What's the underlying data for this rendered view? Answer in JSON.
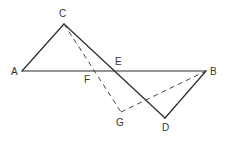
{
  "figure": {
    "points": {
      "A": {
        "label": "A",
        "x": 22,
        "y": 71,
        "lx": 11,
        "ly": 75
      },
      "B": {
        "label": "B",
        "x": 206,
        "y": 71,
        "lx": 210,
        "ly": 75
      },
      "C": {
        "label": "C",
        "x": 64,
        "y": 24,
        "lx": 59,
        "ly": 17
      },
      "D": {
        "label": "D",
        "x": 165,
        "y": 118,
        "lx": 162,
        "ly": 131
      },
      "E": {
        "label": "E",
        "x": 115,
        "y": 71,
        "lx": 115,
        "ly": 65
      },
      "F": {
        "label": "F",
        "x": 93,
        "y": 71,
        "lx": 84,
        "ly": 83
      },
      "G": {
        "label": "G",
        "x": 121,
        "y": 112,
        "lx": 116,
        "ly": 126
      }
    },
    "solid_segments": [
      [
        "A",
        "C"
      ],
      [
        "A",
        "B"
      ],
      [
        "C",
        "D"
      ],
      [
        "D",
        "B"
      ]
    ],
    "dashed_segments": [
      [
        "C",
        "G"
      ],
      [
        "G",
        "B"
      ]
    ],
    "colors": {
      "line": "#2a2a2a",
      "dashed": "#444444",
      "label": "#333333",
      "background": "#ffffff"
    }
  }
}
